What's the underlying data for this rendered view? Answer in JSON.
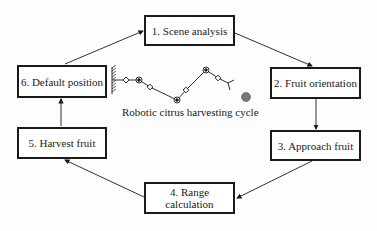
{
  "diagram": {
    "type": "cycle",
    "steps": [
      {
        "id": 1,
        "label": "1. Scene analysis"
      },
      {
        "id": 2,
        "label": "2. Fruit orientation"
      },
      {
        "id": 3,
        "label": "3. Approach fruit"
      },
      {
        "id": 4,
        "label_line1": "4. Range",
        "label_line2": "calculation"
      },
      {
        "id": 5,
        "label": "5. Harvest fruit"
      },
      {
        "id": 6,
        "label": "6. Default position"
      }
    ],
    "edges": [
      {
        "from": 1,
        "to": 2
      },
      {
        "from": 2,
        "to": 3
      },
      {
        "from": 3,
        "to": 4
      },
      {
        "from": 4,
        "to": 5
      },
      {
        "from": 5,
        "to": 6
      },
      {
        "from": 6,
        "to": 1
      }
    ],
    "caption": "Robotic citrus harvesting cycle",
    "illustration": "robot-arm-icon",
    "colors": {
      "line": "#1a1a1a",
      "fruit": "#777777"
    }
  }
}
